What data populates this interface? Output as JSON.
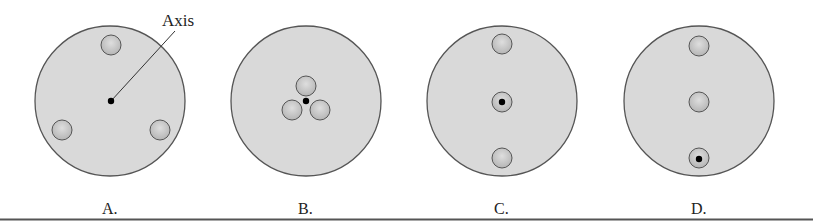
{
  "figure": {
    "colors": {
      "disk_fill": "#d9d9d9",
      "disk_stroke": "#555555",
      "hole_fill": "#c2c2c2",
      "axis_dot": "#000000",
      "bottom_rule": "#555555"
    },
    "annotation": {
      "text": "Axis"
    },
    "panels": [
      {
        "label": "A.",
        "description": "Three holes evenly spaced near rim; axis at disk center"
      },
      {
        "label": "B.",
        "description": "Three holes clustered around central axis"
      },
      {
        "label": "C.",
        "description": "Three holes in vertical line; axis through middle hole"
      },
      {
        "label": "D.",
        "description": "Three holes in vertical line; axis through bottom hole"
      }
    ]
  }
}
